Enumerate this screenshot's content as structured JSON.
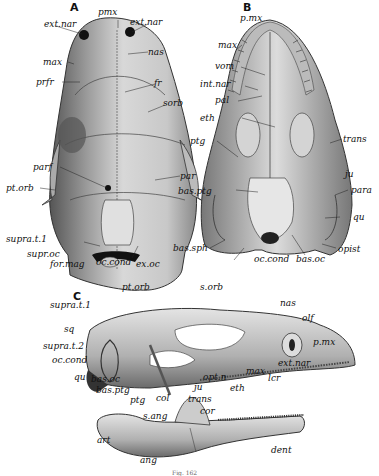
{
  "figure": {
    "caption": "Fig. 162",
    "panels": {
      "A": {
        "letter": "A",
        "view": "dorsal skull",
        "labels": {
          "pmx": "pmx",
          "ext_nar_left": "ext.nar",
          "ext_nar_right": "ext.nar",
          "nas": "nas",
          "max": "max",
          "prfr": "prfr",
          "fr": "fr",
          "sorb": "sorb",
          "par": "par",
          "parf": "parf",
          "pt_orb": "pt.orb",
          "supra_t1": "supra.t.1",
          "suproc": "supr.oc",
          "for_mag": "for.mag",
          "oc_cond": "oc.cond",
          "ex_oc": "ex.oc"
        }
      },
      "B": {
        "letter": "B",
        "view": "ventral skull",
        "labels": {
          "pmx": "p.mx",
          "max": "max",
          "vom": "vom",
          "int_nar": "int.nar",
          "pal": "pal",
          "eth": "eth",
          "ptg": "ptg",
          "trans": "trans",
          "ju": "ju",
          "bas_ptg": "bas.ptg",
          "para": "para",
          "qu": "qu",
          "bas_sph": "bas.sph",
          "opis": "opist",
          "oc_cond": "oc.cond",
          "bas_oc": "bas.oc"
        }
      },
      "C": {
        "letter": "C",
        "view": "lateral skull and mandible",
        "labels": {
          "pt_orb": "pt.orb",
          "s_orb": "s.orb",
          "supra_t1": "supra.t.1",
          "sq": "sq",
          "supra_t2": "supra.t.2",
          "oc_cond": "oc.cond",
          "nas": "nas",
          "olf": "olf",
          "pmx": "p.mx",
          "ext_nar": "ext.nar",
          "max": "max",
          "lcr": "lcr",
          "opt_n": "opt.n",
          "eth": "eth",
          "ju": "ju",
          "qu": "qu",
          "bas_oc": "bas.oc",
          "bas_ptg": "bas.ptg",
          "ptg": "ptg",
          "col": "col",
          "trans": "trans",
          "s_ang": "s.ang",
          "cor": "cor",
          "art": "art",
          "ang": "ang",
          "dent": "dent"
        }
      }
    }
  }
}
